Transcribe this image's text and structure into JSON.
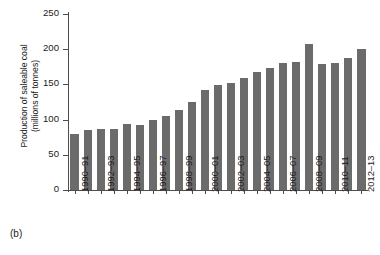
{
  "panel": {
    "tag": "(b)"
  },
  "chart_data": {
    "type": "bar",
    "title": "",
    "xlabel": "",
    "ylabel": "Production of saleable coal (millions of tonnes)",
    "ylabel_line1": "Production of saleable coal",
    "ylabel_line2": "(millions of tonnes)",
    "ylim": [
      0,
      250
    ],
    "yticks": [
      0,
      50,
      100,
      150,
      200,
      250
    ],
    "grid": false,
    "legend": null,
    "bar_color": "#6b6b6b",
    "axis_color": "#4d4d4d",
    "categories": [
      "1990–91",
      "1991–92",
      "1992–93",
      "1993–94",
      "1994–95",
      "1995–96",
      "1996–97",
      "1997–98",
      "1998–99",
      "1999–00",
      "2000–01",
      "2001–02",
      "2002–03",
      "2003–04",
      "2004–05",
      "2005–06",
      "2006–07",
      "2007–08",
      "2008–09",
      "2009–10",
      "2010–11",
      "2011–12",
      "2012–13"
    ],
    "tick_labels_shown": [
      "1990–91",
      "1992–93",
      "1994–95",
      "1996–97",
      "1998–99",
      "2000–01",
      "2002–03",
      "2004–05",
      "2006–07",
      "2008–09",
      "2010–11",
      "2012–13"
    ],
    "values": [
      80,
      85,
      86,
      86,
      94,
      92,
      99,
      105,
      113,
      125,
      142,
      149,
      152,
      159,
      167,
      174,
      180,
      182,
      207,
      179,
      180,
      188,
      200
    ]
  }
}
